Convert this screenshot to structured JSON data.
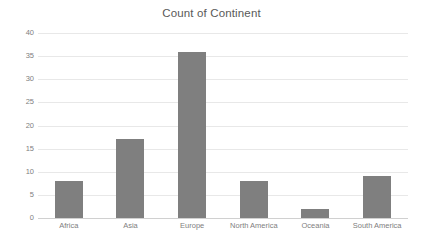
{
  "chart_data": {
    "type": "bar",
    "title": "Count of Continent",
    "xlabel": "",
    "ylabel": "",
    "categories": [
      "Africa",
      "Asia",
      "Europe",
      "North America",
      "Oceania",
      "South America"
    ],
    "values": [
      8,
      17,
      36,
      8,
      2,
      9
    ],
    "ylim": [
      0,
      40
    ],
    "ytick_step": 5,
    "yticks": [
      40,
      35,
      30,
      25,
      20,
      15,
      10,
      5,
      0
    ],
    "ytick_labels": [
      "40",
      "35",
      "30",
      "25",
      "20",
      "15",
      "10",
      "5",
      "0"
    ],
    "grid": true,
    "grid_axis": "y",
    "legend": false,
    "legend_position": "none",
    "bar_color": "#7f7f7f",
    "gridline_color": "#e8e8e8",
    "axis_label_color": "#808080",
    "title_color": "#595959",
    "background_color": "#ffffff"
  }
}
